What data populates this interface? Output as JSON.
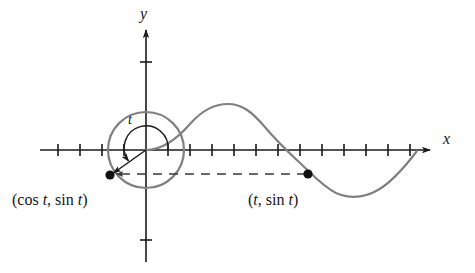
{
  "figure": {
    "axis_labels": {
      "x": "x",
      "y": "y"
    },
    "angle_label": "t",
    "point_labels": {
      "circle_point": "(cos t, sin t)",
      "curve_point": "(t, sin t)"
    },
    "colors": {
      "curve": "#808080",
      "circle": "#808080",
      "axis": "#1a1a1a",
      "dashed": "#3a3a3a",
      "dot": "#111111",
      "background": "#ffffff"
    }
  },
  "chart_data": {
    "type": "line",
    "title": "",
    "xlabel": "x",
    "ylabel": "y",
    "grid": false,
    "legend": null,
    "origin_px": {
      "x": 146,
      "y": 150
    },
    "unit_px": 22,
    "xlim": [
      -4.8,
      12.4
    ],
    "ylim": [
      -3.0,
      3.2
    ],
    "series": [
      {
        "name": "sin x",
        "type": "line",
        "color": "#808080",
        "x_range": [
          0,
          12.0
        ],
        "amplitude": 2.0,
        "period": 12.56,
        "description": "y = sin(x) scaled, drawn from origin rightward through one full period"
      },
      {
        "name": "unit circle",
        "type": "circle",
        "color": "#808080",
        "center": [
          0,
          0
        ],
        "radius": 1.73,
        "description": "circle of radius matching sine amplitude centred at origin"
      }
    ],
    "annotations": [
      {
        "name": "radius-vector",
        "from": [
          0,
          0
        ],
        "to": [
          -1.63,
          -1.14
        ],
        "label": "(cos t, sin t)",
        "arrow": true
      },
      {
        "name": "angle-arc",
        "at": [
          0,
          0
        ],
        "label": "t",
        "start_deg": 0,
        "end_deg": 215,
        "arrow": true
      },
      {
        "name": "horizontal-dashed-connector",
        "from": [
          7.36,
          -1.14
        ],
        "to": [
          -1.63,
          -1.14
        ],
        "arrow": true
      }
    ],
    "points": [
      {
        "name": "circle-point",
        "x": -1.63,
        "y": -1.14,
        "label": "(cos t, sin t)"
      },
      {
        "name": "curve-point",
        "x": 7.36,
        "y": -1.14,
        "label": "(t, sin t)"
      }
    ],
    "x_ticks": [
      -4,
      -3,
      -2,
      -1,
      1,
      2,
      3,
      4,
      5,
      6,
      7,
      8,
      9,
      10,
      11
    ],
    "y_ticks": [
      -2,
      2
    ],
    "tick_labels_shown": false
  }
}
